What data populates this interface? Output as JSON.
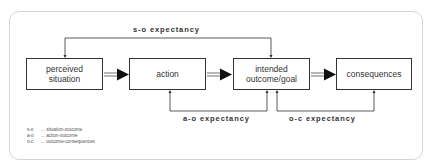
{
  "diagram": {
    "boxes": [
      {
        "id": "perceived-situation",
        "label_line1": "perceived",
        "label_line2": "situation"
      },
      {
        "id": "action",
        "label": "action"
      },
      {
        "id": "intended-outcome",
        "label_line1": "intended",
        "label_line2": "outcome/goal"
      },
      {
        "id": "consequences",
        "label": "consequences"
      }
    ],
    "expectancies": {
      "so": "s-o expectancy",
      "ao": "a-o expectancy",
      "oc": "o-c expectancy"
    },
    "legend": [
      {
        "abbr": "s-o",
        "sep": "...",
        "text": "situation-outcome"
      },
      {
        "abbr": "a-o",
        "sep": "...",
        "text": "action-outcome"
      },
      {
        "abbr": "o-c",
        "sep": "...",
        "text": "outcome-consequences"
      }
    ],
    "colors": {
      "line": "#333333",
      "frame": "#d4d4d4",
      "text": "#333333"
    }
  }
}
